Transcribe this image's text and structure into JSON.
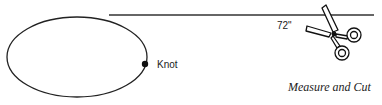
{
  "diagram": {
    "knot_label": "Knot",
    "length_label": "72\"",
    "caption": "Measure and Cut",
    "line_color": "#222222"
  }
}
